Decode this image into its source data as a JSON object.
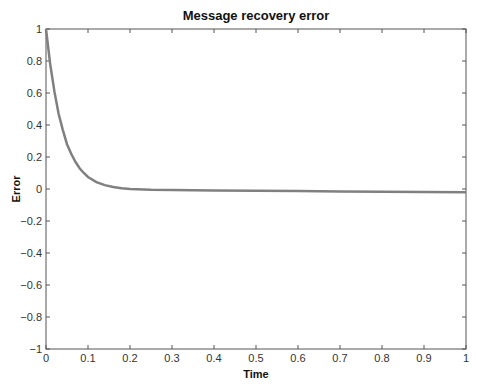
{
  "chart_data": {
    "type": "line",
    "title": "Message recovery error",
    "xlabel": "Time",
    "ylabel": "Error",
    "xlim": [
      0,
      1
    ],
    "ylim": [
      -1,
      1
    ],
    "grid": false,
    "legend": null,
    "xticks": [
      0,
      0.1,
      0.2,
      0.3,
      0.4,
      0.5,
      0.6,
      0.7,
      0.8,
      0.9,
      1
    ],
    "xtick_labels": [
      "0",
      "0.1",
      "0.2",
      "0.3",
      "0.4",
      "0.5",
      "0.6",
      "0.7",
      "0.8",
      "0.9",
      "1"
    ],
    "yticks": [
      1,
      0.8,
      0.6,
      0.4,
      0.2,
      0,
      -0.2,
      -0.4,
      -0.6,
      -0.8,
      -1
    ],
    "ytick_labels": [
      "1",
      "0.8",
      "0.6",
      "0.4",
      "0.2",
      "0",
      "−0.2",
      "−0.4",
      "−0.6",
      "−0.8",
      "−1"
    ],
    "series": [
      {
        "name": "error",
        "color": "#808080",
        "x": [
          0,
          0.01,
          0.02,
          0.03,
          0.04,
          0.05,
          0.06,
          0.07,
          0.08,
          0.09,
          0.1,
          0.12,
          0.14,
          0.16,
          0.18,
          0.2,
          0.25,
          0.3,
          0.4,
          0.5,
          0.6,
          0.7,
          0.8,
          0.9,
          1.0
        ],
        "y": [
          1.0,
          0.78,
          0.61,
          0.47,
          0.37,
          0.28,
          0.22,
          0.17,
          0.13,
          0.1,
          0.075,
          0.043,
          0.024,
          0.012,
          0.005,
          0.0,
          -0.005,
          -0.007,
          -0.009,
          -0.011,
          -0.013,
          -0.015,
          -0.017,
          -0.019,
          -0.021
        ]
      }
    ]
  },
  "caption": {
    "text": "Fig. 3.21  Message recovery error..."
  }
}
